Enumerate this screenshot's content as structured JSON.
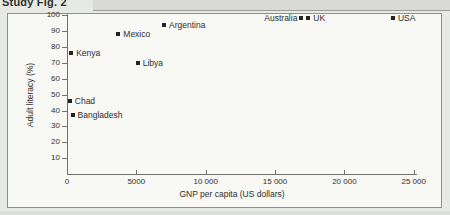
{
  "page": {
    "title": "Study Fig. 2"
  },
  "colors": {
    "page_background": "#e7e9e5",
    "chart_background": "#f8f8f5",
    "frame_border": "#8f8f8c",
    "axis": "#71716e",
    "marker": "#242422",
    "text": "#2e2e2c"
  },
  "chart_data": {
    "type": "scatter",
    "title": "Study Fig. 2",
    "xlabel": "GNP per capita (US dollars)",
    "ylabel": "Adult literacy (%)",
    "xlim": [
      0,
      26000
    ],
    "ylim": [
      0,
      100
    ],
    "grid": false,
    "legend": "none",
    "marker_shape": "filled-square",
    "x_ticks": [
      {
        "value": 0,
        "label": "0"
      },
      {
        "value": 5000,
        "label": "5000"
      },
      {
        "value": 10000,
        "label": "10 000"
      },
      {
        "value": 15000,
        "label": "15 000"
      },
      {
        "value": 20000,
        "label": "20 000"
      },
      {
        "value": 25000,
        "label": "25 000"
      }
    ],
    "y_ticks": [
      {
        "value": 10,
        "label": "10"
      },
      {
        "value": 20,
        "label": "20"
      },
      {
        "value": 30,
        "label": "30"
      },
      {
        "value": 40,
        "label": "40"
      },
      {
        "value": 50,
        "label": "50"
      },
      {
        "value": 60,
        "label": "60"
      },
      {
        "value": 70,
        "label": "70"
      },
      {
        "value": 80,
        "label": "80"
      },
      {
        "value": 90,
        "label": "90"
      },
      {
        "value": 100,
        "label": "100"
      }
    ],
    "points": [
      {
        "name": "Chad",
        "gnp": 200,
        "literacy": 46,
        "label_side": "right"
      },
      {
        "name": "Kenya",
        "gnp": 300,
        "literacy": 76,
        "label_side": "right"
      },
      {
        "name": "Bangladesh",
        "gnp": 400,
        "literacy": 37,
        "label_side": "right"
      },
      {
        "name": "Mexico",
        "gnp": 3700,
        "literacy": 88,
        "label_side": "right"
      },
      {
        "name": "Libya",
        "gnp": 5100,
        "literacy": 70,
        "label_side": "right"
      },
      {
        "name": "Argentina",
        "gnp": 7000,
        "literacy": 94,
        "label_side": "right"
      },
      {
        "name": "Australia",
        "gnp": 16900,
        "literacy": 98,
        "label_side": "left"
      },
      {
        "name": "UK",
        "gnp": 17400,
        "literacy": 98,
        "label_side": "right"
      },
      {
        "name": "USA",
        "gnp": 23500,
        "literacy": 98,
        "label_side": "right"
      }
    ]
  }
}
